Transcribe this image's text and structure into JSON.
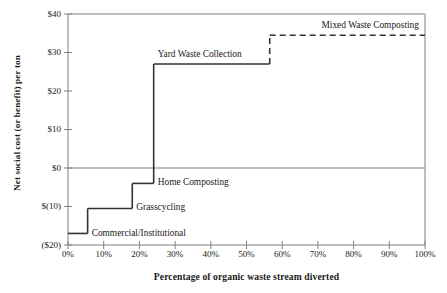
{
  "chart_data": {
    "type": "line",
    "subtype": "step",
    "title": "",
    "xlabel": "Percentage of organic waste stream diverted",
    "ylabel": "Net social cost (or benefit) per ton",
    "xlim": [
      0,
      100
    ],
    "ylim": [
      -20,
      40
    ],
    "grid": false,
    "legend": "inline-annotations",
    "x_tick_labels": [
      "0%",
      "10%",
      "20%",
      "30%",
      "40%",
      "50%",
      "60%",
      "70%",
      "80%",
      "90%",
      "100%"
    ],
    "x_tick_values": [
      0,
      10,
      20,
      30,
      40,
      50,
      60,
      70,
      80,
      90,
      100
    ],
    "y_tick_labels": [
      "$40",
      "$30",
      "$20",
      "$10",
      "$0",
      "$(10)",
      "($20)"
    ],
    "y_tick_values": [
      40,
      30,
      20,
      10,
      0,
      -10,
      -20
    ],
    "zero_reference_line": 0,
    "units": "dollars per ton",
    "steps": [
      {
        "name": "Commercial/Institutional",
        "label": "Commercial/Institutional",
        "x_start": 0,
        "x_end": 5.5,
        "value": -17,
        "style": "solid"
      },
      {
        "name": "Grasscycling",
        "label": "Grasscycling",
        "x_start": 5.5,
        "x_end": 18,
        "value": -10.5,
        "style": "solid"
      },
      {
        "name": "Home Composting",
        "label": "Home Composting",
        "x_start": 18,
        "x_end": 24,
        "value": -4,
        "style": "solid"
      },
      {
        "name": "Yard Waste Collection",
        "label": "Yard Waste Collection",
        "x_start": 24,
        "x_end": 56.5,
        "value": 27,
        "style": "solid"
      },
      {
        "name": "Mixed Waste Composting",
        "label": "Mixed Waste Composting",
        "x_start": 56.5,
        "x_end": 100,
        "value": 34.5,
        "style": "dashed"
      }
    ]
  },
  "annotations": {
    "commercial_institutional": "Commercial/Institutional",
    "grasscycling": "Grasscycling",
    "home_composting": "Home Composting",
    "yard_waste_collection": "Yard Waste Collection",
    "mixed_waste_composting": "Mixed Waste Composting"
  },
  "colors": {
    "series": "#333333",
    "axis": "#808080",
    "zero_line": "#808080",
    "background": "#ffffff",
    "text": "#1a1a1a"
  }
}
